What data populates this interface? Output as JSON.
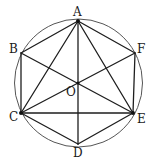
{
  "diagram": {
    "type": "geometry",
    "points": [
      {
        "id": "A",
        "label": "A"
      },
      {
        "id": "B",
        "label": "B"
      },
      {
        "id": "C",
        "label": "C"
      },
      {
        "id": "D",
        "label": "D"
      },
      {
        "id": "E",
        "label": "E"
      },
      {
        "id": "F",
        "label": "F"
      },
      {
        "id": "O",
        "label": "O"
      }
    ],
    "segments": [
      [
        "A",
        "B"
      ],
      [
        "B",
        "C"
      ],
      [
        "C",
        "D"
      ],
      [
        "D",
        "E"
      ],
      [
        "E",
        "F"
      ],
      [
        "F",
        "A"
      ],
      [
        "A",
        "C"
      ],
      [
        "A",
        "E"
      ],
      [
        "C",
        "E"
      ],
      [
        "A",
        "D"
      ],
      [
        "B",
        "E"
      ],
      [
        "C",
        "F"
      ]
    ],
    "marked_points": [
      "A",
      "C",
      "E",
      "O"
    ],
    "circle": {
      "center": "O",
      "through": "A"
    },
    "colors": {
      "line": "#1e1e1e",
      "circle": "#555555",
      "text": "#1a1a1a"
    }
  }
}
